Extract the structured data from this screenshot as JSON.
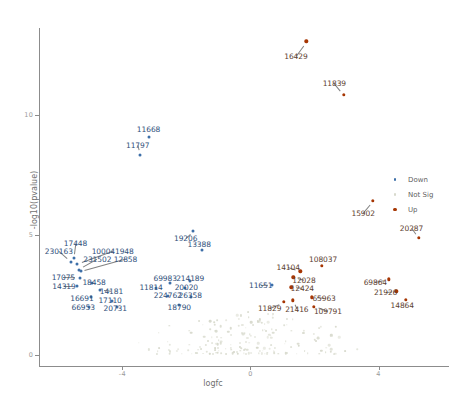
{
  "chart_data": {
    "type": "scatter",
    "title": "",
    "xlabel": "logfc",
    "ylabel": "-log10(pvalue)",
    "xlim": [
      -6.6,
      6.2
    ],
    "ylim": [
      -0.45,
      13.6
    ],
    "xticks": [
      -4,
      0,
      4
    ],
    "xtick_labels": [
      "-4",
      "0",
      "4"
    ],
    "yticks": [
      0,
      5,
      10
    ],
    "ytick_labels": [
      "0",
      "5",
      "10"
    ],
    "grid": false,
    "legend_position": "right",
    "colors": {
      "up": "#a63603",
      "down": "#3d6fa8",
      "not_sig": "#d7d9cc",
      "axis": "#8c8c8c",
      "label_up": "#5c4030",
      "label_down": "#2f4f7a"
    },
    "legend": [
      {
        "name": "legend-down",
        "label": "Down",
        "color": "#3d6fa8"
      },
      {
        "name": "legend-not-sig",
        "label": "Not Sig",
        "color": "#d7d9cc"
      },
      {
        "name": "legend-up",
        "label": "Up",
        "color": "#a63603"
      }
    ],
    "series": [
      {
        "name": "Up",
        "color": "#a63603",
        "points": [
          {
            "label": "16429",
            "x": 1.75,
            "y": 13.05,
            "lx": 1.42,
            "ly": 12.45
          },
          {
            "label": "11839",
            "x": 2.92,
            "y": 10.82,
            "lx": 2.62,
            "ly": 11.3
          },
          {
            "label": "15902",
            "x": 3.83,
            "y": 6.42,
            "lx": 3.52,
            "ly": 5.92
          },
          {
            "label": "20287",
            "x": 5.25,
            "y": 4.88,
            "lx": 5.03,
            "ly": 5.3
          },
          {
            "label": "108037",
            "x": 2.22,
            "y": 3.72,
            "lx": 2.27,
            "ly": 4.0
          },
          {
            "label": "14104",
            "x": 1.56,
            "y": 3.48,
            "lx": 1.18,
            "ly": 3.65
          },
          {
            "label": "12028",
            "x": 1.34,
            "y": 3.24,
            "lx": 1.67,
            "ly": 3.14
          },
          {
            "label": "69864",
            "x": 4.33,
            "y": 3.16,
            "lx": 3.9,
            "ly": 3.04
          },
          {
            "label": "12424",
            "x": 1.28,
            "y": 2.82,
            "lx": 1.62,
            "ly": 2.78
          },
          {
            "label": "21926",
            "x": 4.56,
            "y": 2.66,
            "lx": 4.22,
            "ly": 2.62
          },
          {
            "label": "65963",
            "x": 1.92,
            "y": 2.4,
            "lx": 2.3,
            "ly": 2.36
          },
          {
            "label": "14864",
            "x": 4.86,
            "y": 2.3,
            "lx": 4.74,
            "ly": 2.1
          },
          {
            "label": "21416",
            "x": 1.32,
            "y": 2.28,
            "lx": 1.45,
            "ly": 1.9
          },
          {
            "label": "109791",
            "x": 1.98,
            "y": 2.02,
            "lx": 2.42,
            "ly": 1.82
          },
          {
            "label": "11829",
            "x": 1.04,
            "y": 2.22,
            "lx": 0.6,
            "ly": 1.98
          }
        ]
      },
      {
        "name": "Down",
        "color": "#3d6fa8",
        "points": [
          {
            "label": "11668",
            "x": -3.18,
            "y": 9.08,
            "lx": -3.18,
            "ly": 9.42
          },
          {
            "label": "11797",
            "x": -3.44,
            "y": 8.34,
            "lx": -3.52,
            "ly": 8.74
          },
          {
            "label": "19206",
            "x": -1.78,
            "y": 5.16,
            "lx": -2.02,
            "ly": 4.86
          },
          {
            "label": "13388",
            "x": -1.52,
            "y": 4.36,
            "lx": -1.6,
            "ly": 4.62
          },
          {
            "label": "17448",
            "x": -5.52,
            "y": 4.02,
            "lx": -5.46,
            "ly": 4.66
          },
          {
            "label": "230163",
            "x": -5.6,
            "y": 3.88,
            "lx": -5.98,
            "ly": 4.32
          },
          {
            "label": "100041948",
            "x": -5.42,
            "y": 3.78,
            "lx": -4.3,
            "ly": 4.32
          },
          {
            "label": "231502",
            "x": -5.36,
            "y": 3.56,
            "lx": -4.78,
            "ly": 4.0
          },
          {
            "label": "12858",
            "x": -5.3,
            "y": 3.48,
            "lx": -3.9,
            "ly": 4.0
          },
          {
            "label": "17075",
            "x": -5.32,
            "y": 3.22,
            "lx": -5.84,
            "ly": 3.24
          },
          {
            "label": "18458",
            "x": -4.94,
            "y": 3.0,
            "lx": -4.88,
            "ly": 3.06
          },
          {
            "label": "69983",
            "x": -2.52,
            "y": 3.02,
            "lx": -2.66,
            "ly": 3.2
          },
          {
            "label": "214189",
            "x": -1.9,
            "y": 3.1,
            "lx": -1.88,
            "ly": 3.22
          },
          {
            "label": "14319",
            "x": -5.4,
            "y": 2.88,
            "lx": -5.82,
            "ly": 2.88
          },
          {
            "label": "11814",
            "x": -2.96,
            "y": 2.78,
            "lx": -3.1,
            "ly": 2.82
          },
          {
            "label": "20020",
            "x": -2.04,
            "y": 2.78,
            "lx": -2.0,
            "ly": 2.84
          },
          {
            "label": "11651",
            "x": 0.68,
            "y": 2.92,
            "lx": 0.32,
            "ly": 2.9
          },
          {
            "label": "14181",
            "x": -4.7,
            "y": 2.7,
            "lx": -4.34,
            "ly": 2.66
          },
          {
            "label": "224762",
            "x": -2.56,
            "y": 2.48,
            "lx": -2.58,
            "ly": 2.52
          },
          {
            "label": "26358",
            "x": -1.86,
            "y": 2.4,
            "lx": -1.88,
            "ly": 2.5
          },
          {
            "label": "16691",
            "x": -4.98,
            "y": 2.4,
            "lx": -5.26,
            "ly": 2.38
          },
          {
            "label": "17110",
            "x": -4.32,
            "y": 2.26,
            "lx": -4.38,
            "ly": 2.28
          },
          {
            "label": "18790",
            "x": -2.22,
            "y": 2.1,
            "lx": -2.22,
            "ly": 2.02
          },
          {
            "label": "66953",
            "x": -5.04,
            "y": 2.0,
            "lx": -5.22,
            "ly": 2.0
          },
          {
            "label": "20731",
            "x": -4.16,
            "y": 2.0,
            "lx": -4.22,
            "ly": 1.98
          }
        ]
      },
      {
        "name": "Not Sig",
        "color": "#d7d9cc",
        "count": 180
      }
    ]
  }
}
